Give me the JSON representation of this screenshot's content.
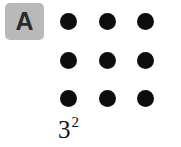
{
  "figure": {
    "background_color": "#ffffff",
    "width": 181,
    "height": 147
  },
  "panel_label": {
    "text": "A",
    "box_color": "#b9b9b9",
    "text_color": "#2b2b2b"
  },
  "caption": {
    "base": "3",
    "exponent": "2",
    "full_text": "3²",
    "color": "#111111"
  },
  "chart_data": {
    "type": "scatter",
    "title": "",
    "subtitle": "",
    "xlabel": "",
    "ylabel": "",
    "annotations": [
      "A",
      "3²"
    ],
    "legend": [],
    "grid": false,
    "rows": 3,
    "columns": 3,
    "total_count": 9,
    "dot_color": "#0d0d0d",
    "dot_diameter": 17,
    "points": [
      {
        "id": "r1c1",
        "row": 1,
        "col": 1,
        "cx": 68,
        "cy": 21
      },
      {
        "id": "r1c2",
        "row": 1,
        "col": 2,
        "cx": 107,
        "cy": 21
      },
      {
        "id": "r1c3",
        "row": 1,
        "col": 3,
        "cx": 145,
        "cy": 21
      },
      {
        "id": "r2c1",
        "row": 2,
        "col": 1,
        "cx": 68,
        "cy": 60
      },
      {
        "id": "r2c2",
        "row": 2,
        "col": 2,
        "cx": 107,
        "cy": 60
      },
      {
        "id": "r2c3",
        "row": 2,
        "col": 3,
        "cx": 145,
        "cy": 60
      },
      {
        "id": "r3c1",
        "row": 3,
        "col": 1,
        "cx": 68,
        "cy": 98
      },
      {
        "id": "r3c2",
        "row": 3,
        "col": 2,
        "cx": 107,
        "cy": 98
      },
      {
        "id": "r3c3",
        "row": 3,
        "col": 3,
        "cx": 145,
        "cy": 98
      }
    ]
  }
}
